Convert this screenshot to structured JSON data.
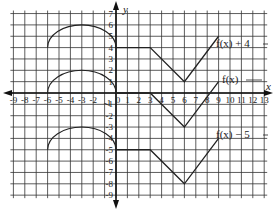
{
  "chart_data": {
    "type": "line",
    "title": "",
    "xlabel": "x",
    "ylabel": "y",
    "xlim": [
      -9,
      13
    ],
    "ylim": [
      -9,
      7
    ],
    "grid": true,
    "x_ticks": [
      "-9",
      "-8",
      "-7",
      "-6",
      "-5",
      "-4",
      "-3",
      "-2",
      "-1",
      "0",
      "1",
      "2",
      "3",
      "4",
      "5",
      "6",
      "7",
      "8",
      "9",
      "10",
      "11",
      "12",
      "13"
    ],
    "y_ticks": [
      "7",
      "6",
      "5",
      "4",
      "3",
      "2",
      "1",
      "-1",
      "-2",
      "-3",
      "-4",
      "-5",
      "-6",
      "-7",
      "-8",
      "-9"
    ],
    "series": [
      {
        "name": "f(x) + 4",
        "label": "f(x) + 4",
        "arc": {
          "start": [
            -6,
            4
          ],
          "peak": [
            -3,
            6
          ],
          "end": [
            0,
            4
          ]
        },
        "points": [
          [
            0,
            4
          ],
          [
            3,
            4
          ],
          [
            6,
            1
          ],
          [
            9,
            5
          ]
        ]
      },
      {
        "name": "f(x)",
        "label": "f(x)",
        "arc": {
          "start": [
            -6,
            0
          ],
          "peak": [
            -3,
            2
          ],
          "end": [
            0,
            0
          ]
        },
        "points": [
          [
            0,
            0
          ],
          [
            3,
            0
          ],
          [
            6,
            -3
          ],
          [
            9,
            1
          ]
        ]
      },
      {
        "name": "f(x) - 5",
        "label": "f(x) − 5",
        "arc": {
          "start": [
            -6,
            -5
          ],
          "peak": [
            -3,
            -3
          ],
          "end": [
            0,
            -5
          ]
        },
        "points": [
          [
            0,
            -5
          ],
          [
            3,
            -5
          ],
          [
            6,
            -8
          ],
          [
            9,
            -4
          ]
        ]
      }
    ],
    "legend_position": "inline-right"
  },
  "labels": {
    "y_axis": "y",
    "x_axis": "x",
    "series_plus4": "f(x) + 4",
    "series_base": "f(x)",
    "series_minus5": "f(x) − 5"
  }
}
